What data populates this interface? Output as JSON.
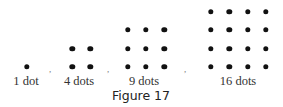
{
  "figure": {
    "caption": "Figure 17",
    "dot_color": "#111111",
    "groups": [
      {
        "label": "1 dot",
        "count": 1,
        "side": 1,
        "label_x": 26,
        "origin_x": 26.7,
        "cols": [
          26.7
        ]
      },
      {
        "label": "4 dots",
        "count": 4,
        "side": 2,
        "label_x": 79,
        "origin_x": 72.3,
        "cols": [
          72.3,
          90.3
        ]
      },
      {
        "label": "9 dots",
        "count": 9,
        "side": 3,
        "label_x": 144,
        "origin_x": 127.7,
        "cols": [
          127.7,
          146,
          164.3
        ]
      },
      {
        "label": "16 dots",
        "count": 16,
        "side": 4,
        "label_x": 238,
        "origin_x": 211,
        "cols": [
          211,
          229.3,
          247.7,
          265.7
        ]
      }
    ],
    "row_y": [
      67,
      48.5,
      30,
      12
    ],
    "separators": [
      {
        "text": ",",
        "x": 50,
        "y": 69
      },
      {
        "text": ",",
        "x": 108,
        "y": 69
      },
      {
        "text": ",",
        "x": 185,
        "y": 69
      }
    ]
  }
}
